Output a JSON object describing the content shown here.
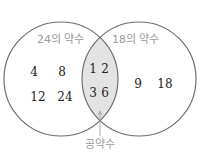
{
  "diagram": {
    "type": "venn",
    "left_set": {
      "label": "24의 약수",
      "only": [
        "4",
        "8",
        "12",
        "24"
      ]
    },
    "right_set": {
      "label": "18의 약수",
      "only": [
        "9",
        "18"
      ]
    },
    "intersection": {
      "values": [
        "1",
        "2",
        "3",
        "6"
      ],
      "label": "공약수",
      "fill": "#e3e3e3"
    },
    "stroke_color": "#6e6e6e",
    "label_color": "#9a9a9a"
  }
}
